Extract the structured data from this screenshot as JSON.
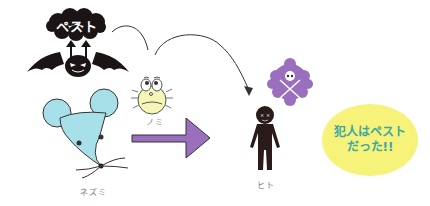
{
  "diagram": {
    "pest": {
      "label": "ペスト",
      "icon": "bat-devil-icon",
      "color": "#1a1414"
    },
    "flea": {
      "label": "ノミ",
      "icon": "flea-icon",
      "color": "#f7f6b8"
    },
    "rat": {
      "label": "ネズミ",
      "icon": "mouse-icon",
      "color": "#a8e0ea"
    },
    "human": {
      "label": "ヒト",
      "icon": "person-icon",
      "color": "#2a1a18"
    },
    "poison": {
      "icon": "skull-crossbones-icon",
      "color": "#9a6fbe"
    },
    "arrow": {
      "icon": "big-right-arrow-icon",
      "color": "#9a6fbe"
    },
    "conclusion": {
      "line1": "犯人はペスト",
      "line2": "だった!!",
      "bubble_color": "#f7f27a",
      "text_color": "#3aa8a0"
    },
    "connections": [
      {
        "from": "pest",
        "to": "flea",
        "style": "curved-line"
      },
      {
        "from": "flea",
        "to": "human",
        "style": "curved-arrow"
      },
      {
        "from": "rat",
        "to": "human",
        "style": "block-arrow"
      }
    ]
  }
}
